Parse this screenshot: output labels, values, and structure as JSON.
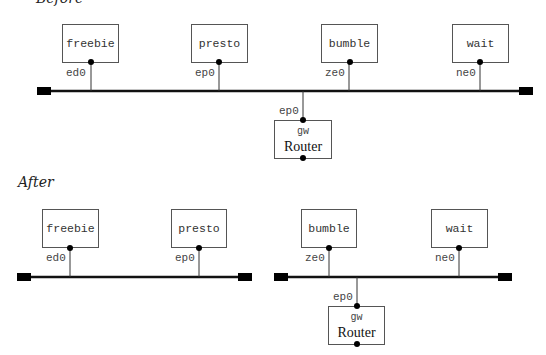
{
  "before": {
    "label": "Before",
    "hosts": [
      {
        "name": "freebie",
        "iface": "ed0"
      },
      {
        "name": "presto",
        "iface": "ep0"
      },
      {
        "name": "bumble",
        "iface": "ze0"
      },
      {
        "name": "wait",
        "iface": "ne0"
      }
    ],
    "router": {
      "name": "gw",
      "label": "Router",
      "iface": "ep0"
    }
  },
  "after": {
    "label": "After",
    "hosts": [
      {
        "name": "freebie",
        "iface": "ed0"
      },
      {
        "name": "presto",
        "iface": "ep0"
      },
      {
        "name": "bumble",
        "iface": "ze0"
      },
      {
        "name": "wait",
        "iface": "ne0"
      }
    ],
    "router": {
      "name": "gw",
      "label": "Router",
      "iface": "ep0"
    }
  }
}
